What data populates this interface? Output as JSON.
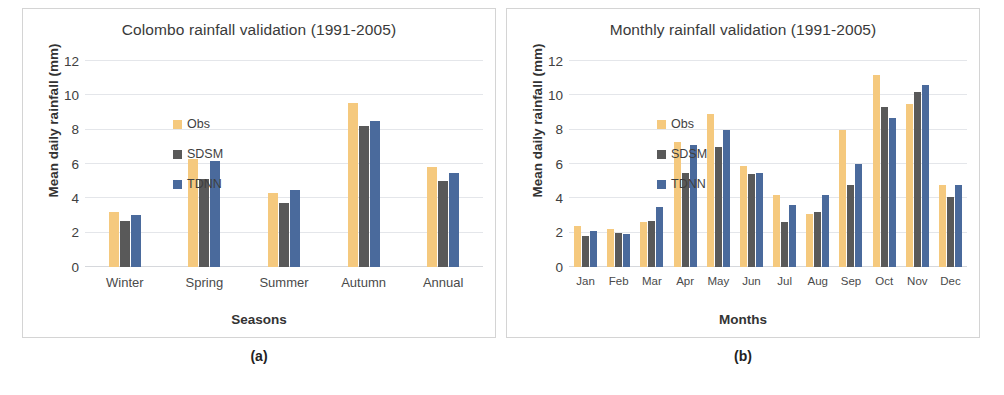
{
  "figure": {
    "captions": {
      "a": "(a)",
      "b": "(b)"
    }
  },
  "legend": {
    "items": [
      {
        "label": "Obs",
        "color": "#F5C97E"
      },
      {
        "label": "SDSM",
        "color": "#595959"
      },
      {
        "label": "TDNN",
        "color": "#4A6A9C"
      }
    ]
  },
  "chart_data": [
    {
      "type": "bar",
      "title": "Colombo rainfall validation (1991-2005)",
      "xlabel": "Seasons",
      "ylabel": "Mean daily rainfall (mm)",
      "ylim": [
        0,
        12
      ],
      "yticks": [
        0,
        2,
        4,
        6,
        8,
        10,
        12
      ],
      "grid": true,
      "legend_position": "top-left inside plot",
      "categories": [
        "Winter",
        "Spring",
        "Summer",
        "Autumn",
        "Annual"
      ],
      "series": [
        {
          "name": "Obs",
          "color": "#F5C97E",
          "values": [
            3.2,
            6.3,
            4.3,
            9.55,
            5.8
          ]
        },
        {
          "name": "SDSM",
          "color": "#595959",
          "values": [
            2.7,
            5.15,
            3.7,
            8.2,
            5.0
          ]
        },
        {
          "name": "TDNN",
          "color": "#4A6A9C",
          "values": [
            3.05,
            6.2,
            4.5,
            8.5,
            5.5
          ]
        }
      ]
    },
    {
      "type": "bar",
      "title": "Monthly rainfall validation (1991-2005)",
      "xlabel": "Months",
      "ylabel": "Mean daily rainfall (mm)",
      "ylim": [
        0,
        12
      ],
      "yticks": [
        0,
        2,
        4,
        6,
        8,
        10,
        12
      ],
      "grid": true,
      "legend_position": "top-left inside plot",
      "categories": [
        "Jan",
        "Feb",
        "Mar",
        "Apr",
        "May",
        "Jun",
        "Jul",
        "Aug",
        "Sep",
        "Oct",
        "Nov",
        "Dec"
      ],
      "series": [
        {
          "name": "Obs",
          "color": "#F5C97E",
          "values": [
            2.4,
            2.2,
            2.6,
            7.3,
            8.9,
            5.9,
            4.2,
            3.1,
            8.0,
            11.2,
            9.5,
            4.8
          ]
        },
        {
          "name": "SDSM",
          "color": "#595959",
          "values": [
            1.8,
            2.0,
            2.7,
            5.5,
            7.0,
            5.4,
            2.6,
            3.2,
            4.8,
            9.3,
            10.2,
            4.1
          ]
        },
        {
          "name": "TDNN",
          "color": "#4A6A9C",
          "values": [
            2.1,
            1.9,
            3.5,
            7.1,
            8.0,
            5.5,
            3.6,
            4.2,
            6.0,
            8.7,
            10.6,
            4.8
          ]
        }
      ]
    }
  ]
}
